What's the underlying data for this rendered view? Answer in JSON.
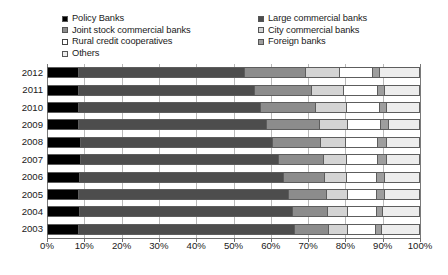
{
  "legend": {
    "left_column": [
      {
        "label": "Policy Banks",
        "key": "policy",
        "color": "#000000"
      },
      {
        "label": "Joint stock commercial banks",
        "key": "joint_stock",
        "color": "#8c8c8c"
      },
      {
        "label": "Rural credit cooperatives",
        "key": "rural",
        "color": "#ffffff"
      },
      {
        "label": "Others",
        "key": "others",
        "color": "#ededed"
      }
    ],
    "right_column": [
      {
        "label": "Large commercial banks",
        "key": "large",
        "color": "#4d4d4d"
      },
      {
        "label": "City commercial banks",
        "key": "city",
        "color": "#d4d4d4"
      },
      {
        "label": "Foreign banks",
        "key": "foreign",
        "color": "#9e9e9e"
      }
    ]
  },
  "axis": {
    "x_ticks": [
      "0%",
      "10%",
      "20%",
      "30%",
      "40%",
      "50%",
      "60%",
      "70%",
      "80%",
      "90%",
      "100%"
    ],
    "y_ticks": [
      "2012",
      "2011",
      "2010",
      "2009",
      "2008",
      "2007",
      "2006",
      "2005",
      "2004",
      "2003"
    ]
  },
  "chart_data": {
    "type": "bar",
    "orientation": "horizontal",
    "stacked": true,
    "normalized_percent": true,
    "title": "",
    "subtitle": "",
    "xlabel": "",
    "ylabel": "",
    "xlim": [
      0,
      100
    ],
    "grid": true,
    "legend_position": "top",
    "categories": [
      "2012",
      "2011",
      "2010",
      "2009",
      "2008",
      "2007",
      "2006",
      "2005",
      "2004",
      "2003"
    ],
    "series": [
      {
        "name": "Policy Banks",
        "key": "policy",
        "color": "#000000",
        "values": [
          8.0,
          8.2,
          8.0,
          8.0,
          8.5,
          8.5,
          8.3,
          8.2,
          8.3,
          8.2
        ]
      },
      {
        "name": "Large commercial banks",
        "key": "large",
        "color": "#4d4d4d",
        "values": [
          44.8,
          47.2,
          49.2,
          50.8,
          51.8,
          53.5,
          55.0,
          56.4,
          57.5,
          58.0
        ]
      },
      {
        "name": "Joint stock commercial banks",
        "key": "joint_stock",
        "color": "#8c8c8c",
        "values": [
          16.4,
          15.5,
          14.8,
          14.2,
          13.0,
          12.0,
          11.0,
          10.3,
          9.5,
          9.2
        ]
      },
      {
        "name": "City commercial banks",
        "key": "city",
        "color": "#d4d4d4",
        "values": [
          9.2,
          8.6,
          8.2,
          7.5,
          6.8,
          6.4,
          6.0,
          5.6,
          5.3,
          5.2
        ]
      },
      {
        "name": "Rural credit cooperatives",
        "key": "rural",
        "color": "#ffffff",
        "values": [
          9.0,
          9.1,
          9.0,
          8.9,
          8.6,
          8.4,
          8.2,
          8.0,
          7.8,
          7.6
        ]
      },
      {
        "name": "Foreign banks",
        "key": "foreign",
        "color": "#9e9e9e",
        "values": [
          1.8,
          1.9,
          1.9,
          2.2,
          2.4,
          2.4,
          2.2,
          2.0,
          1.7,
          1.5
        ]
      },
      {
        "name": "Others",
        "key": "others",
        "color": "#ededed",
        "values": [
          10.8,
          9.5,
          8.9,
          8.4,
          8.9,
          8.8,
          9.3,
          9.5,
          9.9,
          10.3
        ]
      }
    ]
  }
}
